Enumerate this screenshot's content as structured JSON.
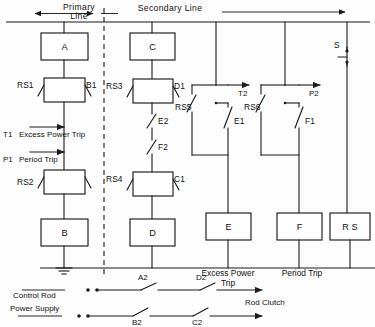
{
  "diagram": {
    "title_primary": "Primary",
    "title_primary_2": "Line",
    "title_secondary": "Secondary  Line",
    "boundary_style": "dashed-vertical-divider",
    "accent_color": "#1b1b1b",
    "background_color": "#fdfdfd"
  },
  "boxes": [
    {
      "id": "A",
      "label": "A"
    },
    {
      "id": "B",
      "label": "B"
    },
    {
      "id": "C",
      "label": "C"
    },
    {
      "id": "D",
      "label": "D"
    },
    {
      "id": "E",
      "label": "E"
    },
    {
      "id": "F",
      "label": "F"
    },
    {
      "id": "RS",
      "label": "R S"
    }
  ],
  "relays": [
    {
      "id": "r1",
      "left_label": "RS1",
      "right_label": "B1"
    },
    {
      "id": "r2",
      "left_label": "RS2",
      "right_label": ""
    },
    {
      "id": "r3",
      "left_label": "RS3",
      "right_label": "D1"
    },
    {
      "id": "r4",
      "left_label": "RS4",
      "right_label": "C1"
    }
  ],
  "contacts": [
    {
      "id": "c_e2",
      "label": "E2"
    },
    {
      "id": "c_f2",
      "label": "F2"
    },
    {
      "id": "c_rs5",
      "label": "RS5"
    },
    {
      "id": "c_e1",
      "label": "E1"
    },
    {
      "id": "c_rs6",
      "label": "RS6"
    },
    {
      "id": "c_f1",
      "label": "F1"
    },
    {
      "id": "c_s",
      "label": "S"
    }
  ],
  "signals": [
    {
      "id": "t1",
      "tag": "T1",
      "text": "Excess Power Trip",
      "direction": "left"
    },
    {
      "id": "p1",
      "tag": "P1",
      "text": "Period  Trip",
      "direction": "left"
    },
    {
      "id": "t2",
      "tag": "T2",
      "direction": "right"
    },
    {
      "id": "p2",
      "tag": "P2",
      "direction": "right"
    }
  ],
  "bottom_labels": {
    "excess_power_trip_1": "Excess Power",
    "excess_power_trip_2": "Trip",
    "period_trip": "Period Trip",
    "rod_clutch": "Rod  Clutch",
    "control_rod": "Control  Rod",
    "power_supply": "Power  Supply"
  },
  "bottom_switches": [
    {
      "id": "a2",
      "label": "A2",
      "row": "top"
    },
    {
      "id": "d2",
      "label": "D2",
      "row": "top"
    },
    {
      "id": "b2",
      "label": "B2",
      "row": "bottom"
    },
    {
      "id": "c2",
      "label": "C2",
      "row": "bottom"
    }
  ],
  "ground": {
    "id": "earth",
    "name": "ground-symbol"
  }
}
